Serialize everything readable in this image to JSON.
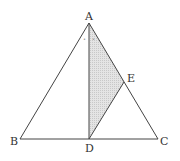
{
  "diagram": {
    "type": "triangle geometry",
    "points": {
      "A": {
        "label": "A",
        "x": 89,
        "y": 23
      },
      "B": {
        "label": "B",
        "x": 20,
        "y": 139
      },
      "C": {
        "label": "C",
        "x": 158,
        "y": 139
      },
      "D": {
        "label": "D",
        "x": 89,
        "y": 139
      },
      "E": {
        "label": "E",
        "x": 124,
        "y": 82
      }
    },
    "segments": [
      "AB",
      "AC",
      "BC",
      "AD",
      "DE"
    ],
    "shaded_region": "triangle ADE",
    "angle_marks": {
      "at": "A",
      "marks": [
        "•",
        "•"
      ],
      "meaning": "AD bisects angle BAC"
    },
    "colors": {
      "stroke": "#444444",
      "shade": "#d9d9d9"
    }
  }
}
